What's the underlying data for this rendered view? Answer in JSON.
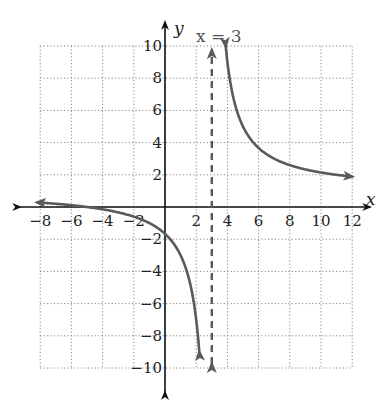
{
  "chart_data": {
    "type": "line",
    "title": "",
    "function": "f(x) = (x+5)/(x-3)",
    "xlabel": "x",
    "ylabel": "y",
    "xlim": [
      -8,
      12
    ],
    "ylim": [
      -10,
      10
    ],
    "grid": true,
    "grid_style": "dotted",
    "x_ticks": [
      -8,
      -6,
      -4,
      -2,
      2,
      4,
      6,
      8,
      10,
      12
    ],
    "y_ticks": [
      -10,
      -8,
      -6,
      -4,
      -2,
      2,
      4,
      6,
      8,
      10
    ],
    "x_tick_labels": [
      "−8",
      "−6",
      "−4",
      "−2",
      "2",
      "4",
      "6",
      "8",
      "10",
      "12"
    ],
    "y_tick_labels": [
      "−10",
      "−8",
      "−6",
      "−4",
      "−2",
      "2",
      "4",
      "6",
      "8",
      "10"
    ],
    "asymptote": {
      "label": "x = 3",
      "x": 3,
      "style": "dashed"
    },
    "series": [
      {
        "name": "left branch",
        "x": [
          -8,
          -6,
          -4,
          -2,
          0,
          1,
          2,
          2.2
        ],
        "y": [
          0.27,
          0.11,
          -0.14,
          -0.6,
          -1.67,
          -3,
          -7,
          -9
        ]
      },
      {
        "name": "right branch",
        "x": [
          3.9,
          4,
          5,
          6,
          8,
          10,
          12
        ],
        "y": [
          9.9,
          9,
          5,
          3.67,
          2.6,
          2.14,
          1.89
        ]
      }
    ],
    "colors": {
      "curve": "#5a5a5a",
      "axes": "#111111",
      "grid": "#888888",
      "asymptote": "#5a5a5a"
    }
  }
}
